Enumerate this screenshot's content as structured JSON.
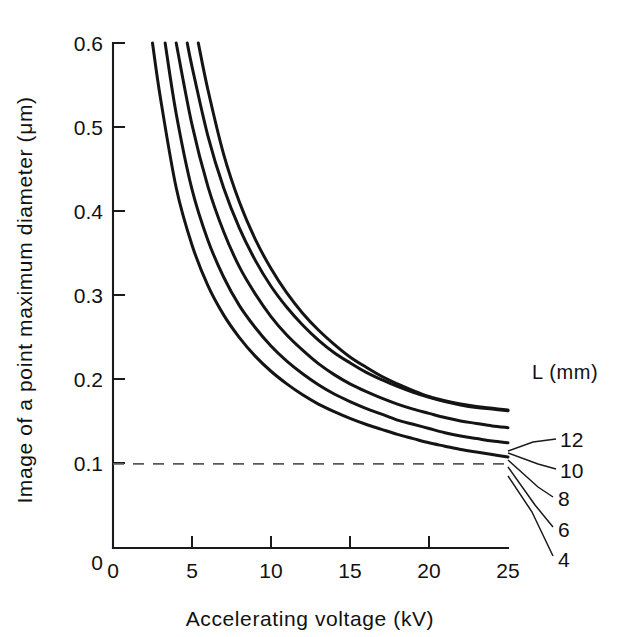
{
  "figure": {
    "background_color": "#ffffff",
    "line_color": "#141414"
  },
  "axes": {
    "x_title": "Accelerating  voltage  (kV)",
    "y_title": "Image of a point maximum diameter  (μm)",
    "x_ticklabels": [
      "0",
      "5",
      "10",
      "15",
      "20",
      "25"
    ],
    "y_ticklabels": [
      "0",
      "0.1",
      "0.2",
      "0.3",
      "0.4",
      "0.5",
      "0.6"
    ]
  },
  "legend": {
    "title": "L (mm)",
    "labels": [
      "12",
      "10",
      "8",
      "6",
      "4"
    ]
  },
  "annotations": {
    "reference_line_value": "0.1"
  },
  "chart_data": {
    "type": "line",
    "title": "",
    "xlabel": "Accelerating  voltage  (kV)",
    "ylabel": "Image of a point maximum diameter  (μm)",
    "xlim": [
      0,
      25
    ],
    "ylim": [
      0,
      0.6
    ],
    "xticks": [
      0,
      5,
      10,
      15,
      20,
      25
    ],
    "yticks": [
      0,
      0.1,
      0.2,
      0.3,
      0.4,
      0.5,
      0.6
    ],
    "grid": false,
    "legend_position": "right-outside",
    "legend_title": "L (mm)",
    "reference_lines": [
      {
        "orientation": "horizontal",
        "value": 0.1,
        "style": "dashed",
        "x_from": 0,
        "x_to": 25
      }
    ],
    "series": [
      {
        "name": "12",
        "x": [
          5.4,
          6,
          7,
          8,
          9,
          10,
          11,
          12,
          13,
          14,
          15,
          16,
          17,
          18,
          19,
          20,
          21,
          22,
          23,
          24,
          25
        ],
        "y": [
          0.6,
          0.545,
          0.468,
          0.411,
          0.367,
          0.332,
          0.303,
          0.279,
          0.259,
          0.242,
          0.227,
          0.215,
          0.204,
          0.195,
          0.187,
          0.18,
          0.175,
          0.171,
          0.168,
          0.166,
          0.164
        ]
      },
      {
        "name": "10",
        "x": [
          4.7,
          5,
          6,
          7,
          8,
          9,
          10,
          11,
          12,
          13,
          14,
          15,
          16,
          17,
          18,
          19,
          20,
          21,
          22,
          23,
          24,
          25
        ],
        "y": [
          0.6,
          0.572,
          0.49,
          0.428,
          0.38,
          0.342,
          0.311,
          0.286,
          0.265,
          0.247,
          0.232,
          0.22,
          0.209,
          0.2,
          0.192,
          0.185,
          0.179,
          0.174,
          0.17,
          0.167,
          0.165,
          0.163
        ]
      },
      {
        "name": "8",
        "x": [
          4.0,
          5,
          6,
          7,
          8,
          9,
          10,
          11,
          12,
          13,
          14,
          15,
          16,
          17,
          18,
          19,
          20,
          21,
          22,
          23,
          24,
          25
        ],
        "y": [
          0.6,
          0.503,
          0.43,
          0.376,
          0.334,
          0.302,
          0.275,
          0.253,
          0.235,
          0.219,
          0.206,
          0.195,
          0.186,
          0.178,
          0.171,
          0.165,
          0.16,
          0.155,
          0.151,
          0.148,
          0.145,
          0.143
        ]
      },
      {
        "name": "6",
        "x": [
          3.3,
          4,
          5,
          6,
          7,
          8,
          9,
          10,
          11,
          12,
          13,
          14,
          15,
          16,
          17,
          18,
          19,
          20,
          21,
          22,
          23,
          24,
          25
        ],
        "y": [
          0.6,
          0.516,
          0.426,
          0.366,
          0.322,
          0.288,
          0.262,
          0.24,
          0.222,
          0.207,
          0.194,
          0.183,
          0.174,
          0.166,
          0.159,
          0.152,
          0.147,
          0.142,
          0.137,
          0.133,
          0.13,
          0.127,
          0.125
        ]
      },
      {
        "name": "4",
        "x": [
          2.5,
          3,
          4,
          5,
          6,
          7,
          8,
          9,
          10,
          11,
          12,
          13,
          14,
          15,
          16,
          17,
          18,
          19,
          20,
          21,
          22,
          23,
          24,
          25
        ],
        "y": [
          0.6,
          0.535,
          0.428,
          0.36,
          0.312,
          0.277,
          0.25,
          0.228,
          0.21,
          0.195,
          0.182,
          0.171,
          0.162,
          0.154,
          0.147,
          0.141,
          0.135,
          0.13,
          0.125,
          0.121,
          0.117,
          0.114,
          0.111,
          0.108
        ]
      }
    ]
  }
}
